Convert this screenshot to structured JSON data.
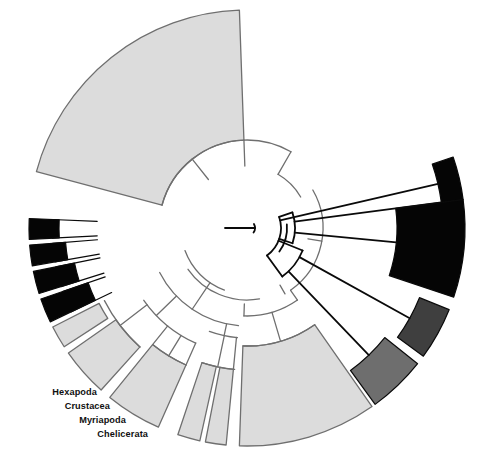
{
  "figure": {
    "type": "circular-phylogenetic-tree",
    "width": 487,
    "height": 468,
    "background": "#ffffff",
    "center_x": 247,
    "center_y": 228,
    "inner_radius": 34,
    "outer_radius": 218
  },
  "palette": {
    "black": "#050505",
    "dark_gray": "#3f3f3f",
    "medium_gray": "#6e6e6e",
    "light_gray": "#dcdcdc",
    "white": "#ffffff",
    "outline_gray": "#6f6f6f",
    "outline_black": "#0a0a0a",
    "label_color": "#101010"
  },
  "labels": [
    {
      "id": "hexapoda",
      "text": "Hexapoda",
      "x": 97,
      "y": 395
    },
    {
      "id": "crustacea",
      "text": "Crustacea",
      "x": 110,
      "y": 409
    },
    {
      "id": "myriapoda",
      "text": "Myriapoda",
      "x": 126,
      "y": 423
    },
    {
      "id": "chelicerata",
      "text": "Chelicerata",
      "x": 148,
      "y": 437
    }
  ],
  "chart_data": {
    "type": "tree",
    "title": "",
    "layout": "circular-fan",
    "legend": [
      {
        "label": "Hexapoda",
        "color": "#050505"
      },
      {
        "label": "Crustacea",
        "color": "#050505"
      },
      {
        "label": "Myriapoda",
        "color": "#050505"
      },
      {
        "label": "Chelicerata",
        "color": "#050505"
      }
    ],
    "wedges": [
      {
        "id": "w-top-large",
        "a0": 195.0,
        "a1": 268.0,
        "r0": 88,
        "r1": 218,
        "fill": "light_gray",
        "stroke": "outline_gray",
        "sw": 1.3
      },
      {
        "id": "w-black-1",
        "a0": 341.0,
        "a1": 352.5,
        "r0": 196,
        "r1": 218,
        "fill": "black",
        "stroke": "outline_black",
        "sw": 1.2
      },
      {
        "id": "w-black-2",
        "a0": 352.5,
        "a1": 378.5,
        "r0": 150,
        "r1": 218,
        "fill": "black",
        "stroke": "outline_black",
        "sw": 1.2
      },
      {
        "id": "w-darkgray-1",
        "a0": 382.0,
        "a1": 396.0,
        "r0": 186,
        "r1": 218,
        "fill": "dark_gray",
        "stroke": "outline_black",
        "sw": 1.2
      },
      {
        "id": "w-medgray-1",
        "a0": 398.5,
        "a1": 414.0,
        "r0": 176,
        "r1": 218,
        "fill": "medium_gray",
        "stroke": "outline_black",
        "sw": 1.2
      },
      {
        "id": "w-lgray-right",
        "a0": 415.0,
        "a1": 452.0,
        "r0": 118,
        "r1": 218,
        "fill": "light_gray",
        "stroke": "outline_gray",
        "sw": 1.3
      },
      {
        "id": "w-lgray-bot1",
        "a0": 455.5,
        "a1": 461.0,
        "r0": 142,
        "r1": 218,
        "fill": "light_gray",
        "stroke": "outline_gray",
        "sw": 1.3
      },
      {
        "id": "w-lgray-bot2",
        "a0": 462.5,
        "a1": 468.5,
        "r0": 142,
        "r1": 218,
        "fill": "light_gray",
        "stroke": "outline_gray",
        "sw": 1.3
      },
      {
        "id": "w-lgray-bot3",
        "a0": 474.0,
        "a1": 489.0,
        "r0": 150,
        "r1": 218,
        "fill": "light_gray",
        "stroke": "outline_gray",
        "sw": 1.3
      },
      {
        "id": "w-lgray-bot4",
        "a0": 492.0,
        "a1": 505.0,
        "r0": 160,
        "r1": 218,
        "fill": "light_gray",
        "stroke": "outline_gray",
        "sw": 1.3
      },
      {
        "id": "w-lgray-bot5",
        "a0": 507.0,
        "a1": 513.0,
        "r0": 166,
        "r1": 218,
        "fill": "light_gray",
        "stroke": "outline_gray",
        "sw": 1.3
      },
      {
        "id": "w-chelicerata",
        "a0": 514.5,
        "a1": 521.0,
        "r0": 168,
        "r1": 218,
        "fill": "black",
        "stroke": "outline_black",
        "sw": 1.2
      },
      {
        "id": "w-myriapoda",
        "a0": 522.5,
        "a1": 528.5,
        "r0": 176,
        "r1": 218,
        "fill": "black",
        "stroke": "outline_black",
        "sw": 1.2
      },
      {
        "id": "w-crustacea",
        "a0": 530.0,
        "a1": 535.5,
        "r0": 182,
        "r1": 218,
        "fill": "black",
        "stroke": "outline_black",
        "sw": 1.2
      },
      {
        "id": "w-hexapoda",
        "a0": 537.0,
        "a1": 542.5,
        "r0": 188,
        "r1": 218,
        "fill": "black",
        "stroke": "outline_black",
        "sw": 1.2
      }
    ]
  }
}
